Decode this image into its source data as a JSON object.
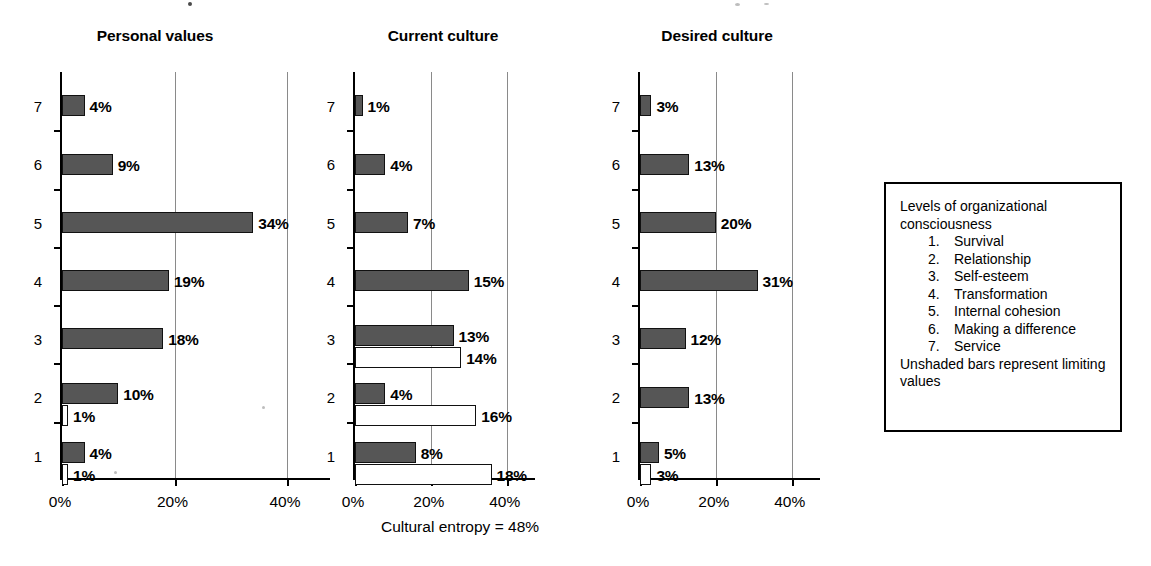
{
  "chart_data": [
    {
      "type": "bar",
      "orientation": "horizontal",
      "title": "Personal values",
      "xlabel": "",
      "ylabel": "",
      "categories": [
        "1",
        "2",
        "3",
        "4",
        "5",
        "6",
        "7"
      ],
      "xticks": [
        "0%",
        "20%",
        "40%"
      ],
      "xtick_values": [
        0,
        20,
        40
      ],
      "xlim": [
        0,
        48
      ],
      "grid": true,
      "legend_position": "none",
      "series": [
        {
          "name": "values",
          "style": "shaded",
          "values": [
            4,
            10,
            18,
            19,
            34,
            9,
            4
          ],
          "labels": [
            "4%",
            "10%",
            "18%",
            "19%",
            "34%",
            "9%",
            "4%"
          ]
        },
        {
          "name": "limiting values",
          "style": "unshaded",
          "values": [
            1,
            1,
            null,
            null,
            null,
            null,
            null
          ],
          "labels": [
            "1%",
            "1%",
            null,
            null,
            null,
            null,
            null
          ]
        }
      ]
    },
    {
      "type": "bar",
      "orientation": "horizontal",
      "title": "Current culture",
      "xlabel": "",
      "ylabel": "",
      "categories": [
        "1",
        "2",
        "3",
        "4",
        "5",
        "6",
        "7"
      ],
      "xticks": [
        "0%",
        "20%",
        "40%"
      ],
      "xtick_values": [
        0,
        20,
        40
      ],
      "xlim": [
        0,
        48
      ],
      "grid": true,
      "legend_position": "none",
      "series": [
        {
          "name": "values",
          "style": "shaded",
          "values": [
            8,
            4,
            13,
            15,
            7,
            4,
            1
          ],
          "labels": [
            "8%",
            "4%",
            "13%",
            "15%",
            "7%",
            "4%",
            "1%"
          ]
        },
        {
          "name": "limiting values",
          "style": "unshaded",
          "values": [
            18,
            16,
            14,
            null,
            null,
            null,
            null
          ],
          "labels": [
            "18%",
            "16%",
            "14%",
            null,
            null,
            null,
            null
          ]
        }
      ]
    },
    {
      "type": "bar",
      "orientation": "horizontal",
      "title": "Desired culture",
      "xlabel": "",
      "ylabel": "",
      "categories": [
        "1",
        "2",
        "3",
        "4",
        "5",
        "6",
        "7"
      ],
      "xticks": [
        "0%",
        "20%",
        "40%"
      ],
      "xtick_values": [
        0,
        20,
        40
      ],
      "xlim": [
        0,
        48
      ],
      "grid": true,
      "legend_position": "none",
      "series": [
        {
          "name": "values",
          "style": "shaded",
          "values": [
            5,
            13,
            12,
            31,
            20,
            13,
            3
          ],
          "labels": [
            "5%",
            "13%",
            "12%",
            "31%",
            "20%",
            "13%",
            "3%"
          ]
        },
        {
          "name": "limiting values",
          "style": "unshaded",
          "values": [
            3,
            null,
            null,
            null,
            null,
            null,
            null
          ],
          "labels": [
            "3%",
            null,
            null,
            null,
            null,
            null,
            null
          ]
        }
      ]
    }
  ],
  "caption": "Cultural entropy = 48%",
  "legend": {
    "heading": "Levels of organizational consciousness",
    "items": [
      {
        "number": "1.",
        "label": "Survival"
      },
      {
        "number": "2.",
        "label": "Relationship"
      },
      {
        "number": "3.",
        "label": "Self-esteem"
      },
      {
        "number": "4.",
        "label": "Transformation"
      },
      {
        "number": "5.",
        "label": "Internal cohesion"
      },
      {
        "number": "6.",
        "label": "Making a difference"
      },
      {
        "number": "7.",
        "label": "Service"
      }
    ],
    "footnote": "Unshaded bars represent limiting values"
  },
  "colors": {
    "shaded_bar": "#565656",
    "unshaded_bar": "#ffffff",
    "bar_outline": "#111111",
    "axis": "#000000",
    "gridline": "#8a8a8a",
    "text": "#000000",
    "background": "#ffffff"
  }
}
